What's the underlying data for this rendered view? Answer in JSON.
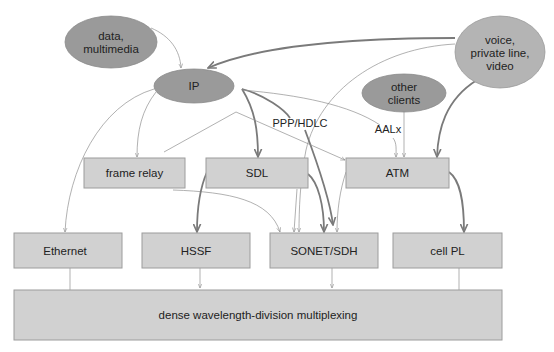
{
  "diagram": {
    "title": "",
    "sources": [
      {
        "id": "data-multimedia",
        "lines": [
          "data,",
          "multimedia"
        ]
      },
      {
        "id": "ip",
        "lines": [
          "IP"
        ]
      },
      {
        "id": "voice",
        "lines": [
          "voice,",
          "private line,",
          "video"
        ]
      },
      {
        "id": "other-clients",
        "lines": [
          "other",
          "clients"
        ]
      }
    ],
    "middle_layer": [
      {
        "id": "frame-relay",
        "label": "frame relay"
      },
      {
        "id": "sdl",
        "label": "SDL"
      },
      {
        "id": "atm",
        "label": "ATM"
      }
    ],
    "physical_layer": [
      {
        "id": "ethernet",
        "label": "Ethernet"
      },
      {
        "id": "hssf",
        "label": "HSSF"
      },
      {
        "id": "sonet-sdh",
        "label": "SONET/SDH"
      },
      {
        "id": "cell-pl",
        "label": "cell PL"
      }
    ],
    "base_layer": {
      "id": "dwdm",
      "label": "dense wavelength-division multiplexing"
    },
    "edge_labels": {
      "ppp_hdlc": "PPP/HDLC",
      "aalx": "AALx"
    },
    "edges": [
      {
        "from": "data-multimedia",
        "to": "ip",
        "weight": "thin"
      },
      {
        "from": "voice",
        "to": "ip",
        "weight": "thick"
      },
      {
        "from": "voice",
        "to": "sonet-sdh",
        "weight": "thin"
      },
      {
        "from": "voice",
        "to": "atm",
        "weight": "thick"
      },
      {
        "from": "ip",
        "to": "frame-relay",
        "weight": "thin"
      },
      {
        "from": "ip",
        "to": "ethernet",
        "weight": "thin"
      },
      {
        "from": "ip",
        "to": "sdl",
        "weight": "thick"
      },
      {
        "from": "ip",
        "to": "sonet-sdh",
        "weight": "thick",
        "label": "PPP/HDLC"
      },
      {
        "from": "ip",
        "to": "atm",
        "weight": "thin",
        "label": "AALx"
      },
      {
        "from": "frame-relay",
        "to": "atm",
        "weight": "thin"
      },
      {
        "from": "frame-relay",
        "to": "sonet-sdh",
        "weight": "thin"
      },
      {
        "from": "other-clients",
        "to": "atm",
        "weight": "thin"
      },
      {
        "from": "sdl",
        "to": "hssf",
        "weight": "thick"
      },
      {
        "from": "sdl",
        "to": "sonet-sdh",
        "weight": "thick"
      },
      {
        "from": "atm",
        "to": "sonet-sdh",
        "weight": "thin"
      },
      {
        "from": "atm",
        "to": "cell-pl",
        "weight": "thick"
      },
      {
        "from": "ethernet",
        "to": "dwdm",
        "weight": "thin"
      },
      {
        "from": "hssf",
        "to": "dwdm",
        "weight": "thin"
      },
      {
        "from": "sonet-sdh",
        "to": "dwdm",
        "weight": "thin"
      },
      {
        "from": "cell-pl",
        "to": "dwdm",
        "weight": "thin"
      }
    ],
    "colors": {
      "ellipse_dark": "#9a9a9a",
      "ellipse_light": "#b4b4b4",
      "box_fill": "#d1d1d1",
      "box_stroke": "#9c9c9c",
      "edge": "#7a7a7a"
    }
  }
}
